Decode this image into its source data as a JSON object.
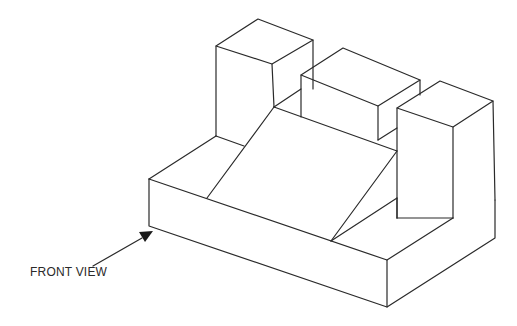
{
  "figure": {
    "type": "isometric-drawing",
    "annotation": {
      "label": "FRONT VIEW",
      "arrow": "arrow pointing to front face"
    },
    "colors": {
      "line": "#2a2a2a",
      "background": "#ffffff"
    }
  }
}
